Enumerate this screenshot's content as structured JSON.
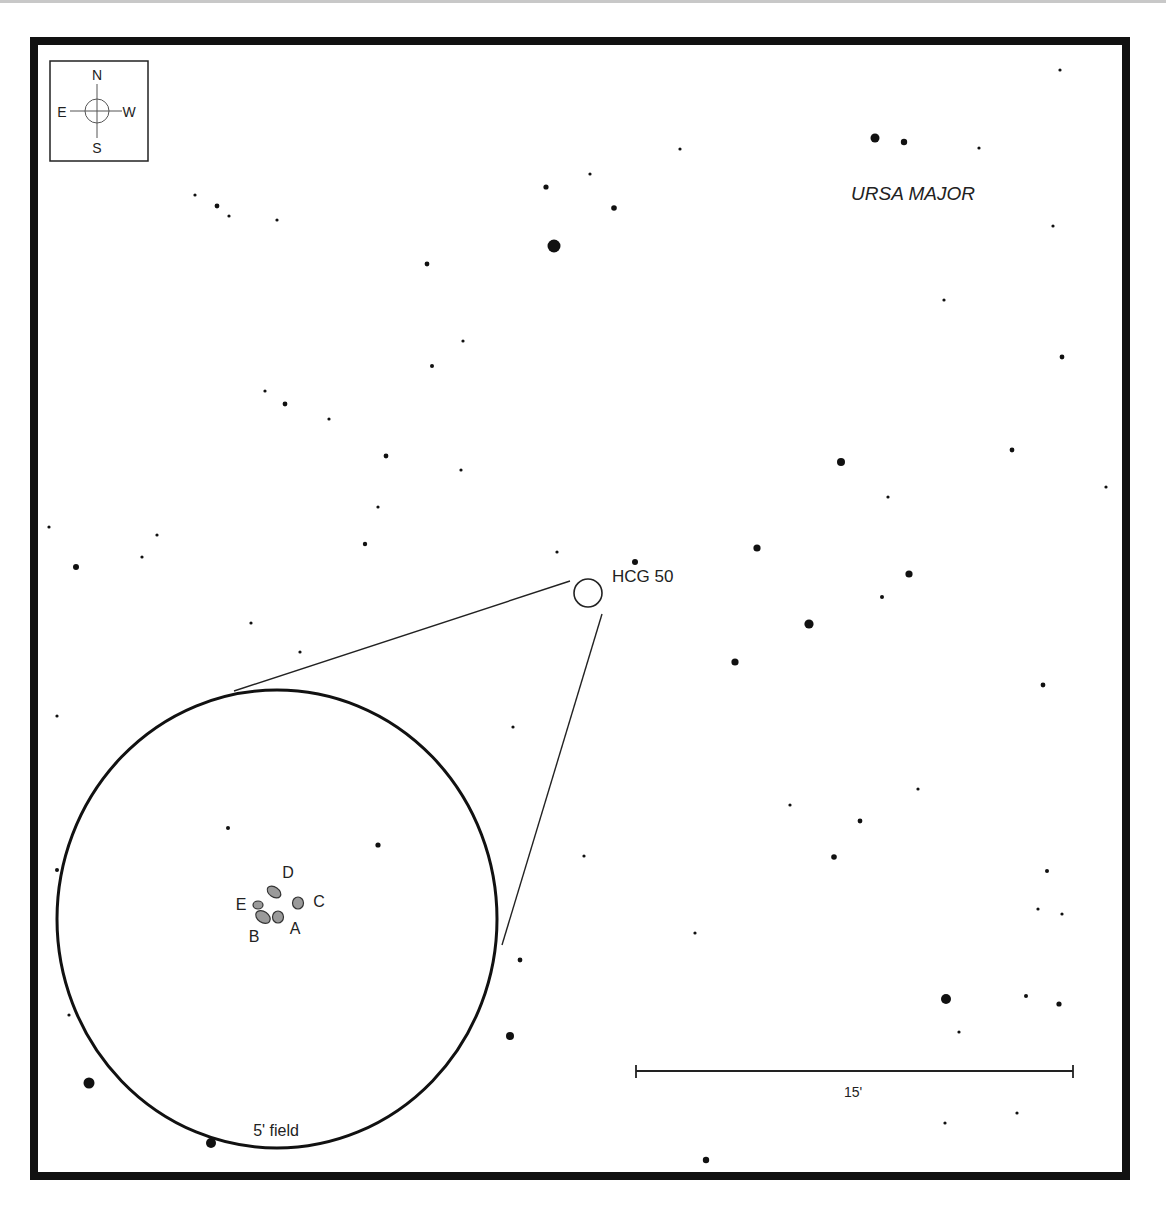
{
  "chart": {
    "object_label": "HCG 50",
    "constellation": "URSA MAJOR",
    "field_label": "5' field",
    "scale_label": "15'",
    "compass": {
      "north": "N",
      "south": "S",
      "east": "E",
      "west": "W"
    },
    "galaxies": [
      {
        "id": "A",
        "label": "A"
      },
      {
        "id": "B",
        "label": "B"
      },
      {
        "id": "C",
        "label": "C"
      },
      {
        "id": "D",
        "label": "D"
      },
      {
        "id": "E",
        "label": "E"
      }
    ],
    "colors": {
      "border": "#111111",
      "star": "#111111",
      "galaxy_fill": "#9a9a9a",
      "text": "#222222"
    }
  },
  "stars": [
    [
      1060,
      70,
      1.6
    ],
    [
      680,
      149,
      1.6
    ],
    [
      875,
      138,
      4.5
    ],
    [
      904,
      142,
      3.2
    ],
    [
      979,
      148,
      1.6
    ],
    [
      1053,
      226,
      1.6
    ],
    [
      944,
      300,
      1.6
    ],
    [
      1062,
      357,
      2.4
    ],
    [
      546,
      187,
      2.6
    ],
    [
      590,
      174,
      1.6
    ],
    [
      614,
      208,
      2.8
    ],
    [
      554,
      246,
      6.5
    ],
    [
      195,
      195,
      1.6
    ],
    [
      217,
      206,
      2.4
    ],
    [
      229,
      216,
      1.6
    ],
    [
      277,
      220,
      1.6
    ],
    [
      427,
      264,
      2.4
    ],
    [
      463,
      341,
      1.6
    ],
    [
      432,
      366,
      2
    ],
    [
      265,
      391,
      1.6
    ],
    [
      285,
      404,
      2.4
    ],
    [
      329,
      419,
      1.6
    ],
    [
      386,
      456,
      2.4
    ],
    [
      461,
      470,
      1.6
    ],
    [
      378,
      507,
      1.6
    ],
    [
      365,
      544,
      2.2
    ],
    [
      49,
      527,
      1.6
    ],
    [
      157,
      535,
      1.6
    ],
    [
      142,
      557,
      1.6
    ],
    [
      76,
      567,
      3
    ],
    [
      557,
      552,
      1.6
    ],
    [
      251,
      623,
      1.6
    ],
    [
      300,
      652,
      1.6
    ],
    [
      57,
      716,
      1.6
    ],
    [
      513,
      727,
      1.6
    ],
    [
      635,
      562,
      3
    ],
    [
      841,
      462,
      4
    ],
    [
      888,
      497,
      1.6
    ],
    [
      1012,
      450,
      2.4
    ],
    [
      1106,
      487,
      1.6
    ],
    [
      757,
      548,
      3.6
    ],
    [
      909,
      574,
      3.6
    ],
    [
      882,
      597,
      2
    ],
    [
      809,
      624,
      4.6
    ],
    [
      735,
      662,
      3.6
    ],
    [
      1043,
      685,
      2.4
    ],
    [
      584,
      856,
      1.6
    ],
    [
      790,
      805,
      1.6
    ],
    [
      860,
      821,
      2.4
    ],
    [
      918,
      789,
      1.6
    ],
    [
      834,
      857,
      2.8
    ],
    [
      695,
      933,
      1.6
    ],
    [
      1047,
      871,
      2
    ],
    [
      1038,
      909,
      1.6
    ],
    [
      1062,
      914,
      1.6
    ],
    [
      946,
      999,
      5
    ],
    [
      1026,
      996,
      2
    ],
    [
      1059,
      1004,
      2.6
    ],
    [
      959,
      1032,
      1.6
    ],
    [
      228,
      828,
      2
    ],
    [
      378,
      845,
      2.6
    ],
    [
      57,
      870,
      2
    ],
    [
      69,
      1015,
      1.6
    ],
    [
      89,
      1083,
      5.5
    ],
    [
      211,
      1143,
      5
    ],
    [
      510,
      1036,
      4
    ],
    [
      520,
      960,
      2.4
    ],
    [
      706,
      1160,
      3.2
    ],
    [
      945,
      1123,
      1.6
    ],
    [
      1017,
      1113,
      1.6
    ]
  ]
}
